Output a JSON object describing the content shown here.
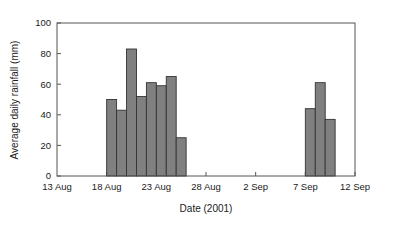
{
  "chart_data": {
    "type": "bar",
    "title": "",
    "xlabel": "Date (2001)",
    "ylabel": "Average daily rainfall (mm)",
    "ylim": [
      0,
      100
    ],
    "ytick_labels": [
      "0",
      "20",
      "40",
      "60",
      "80",
      "100"
    ],
    "ytick_values": [
      0,
      20,
      40,
      60,
      80,
      100
    ],
    "xtick_labels": [
      "13 Aug",
      "18 Aug",
      "23 Aug",
      "28 Aug",
      "2 Sep",
      "7 Sep",
      "12 Sep"
    ],
    "xtick_days": [
      0,
      5,
      10,
      15,
      20,
      25,
      30
    ],
    "x_day_range": [
      0,
      30
    ],
    "grid": false,
    "legend": null,
    "bar_fill_color": "#808080",
    "bar_edge_color": "#333333",
    "axis_color": "#555555",
    "bars": [
      {
        "day": 5,
        "label": "18 Aug",
        "value": 50
      },
      {
        "day": 6,
        "label": "19 Aug",
        "value": 43
      },
      {
        "day": 7,
        "label": "20 Aug",
        "value": 83
      },
      {
        "day": 8,
        "label": "21 Aug",
        "value": 52
      },
      {
        "day": 9,
        "label": "22 Aug",
        "value": 61
      },
      {
        "day": 10,
        "label": "23 Aug",
        "value": 59
      },
      {
        "day": 11,
        "label": "24 Aug",
        "value": 65
      },
      {
        "day": 12,
        "label": "25 Aug",
        "value": 25
      },
      {
        "day": 25,
        "label": "7 Sep",
        "value": 44
      },
      {
        "day": 26,
        "label": "8 Sep",
        "value": 61
      },
      {
        "day": 27,
        "label": "9 Sep",
        "value": 37
      }
    ]
  }
}
